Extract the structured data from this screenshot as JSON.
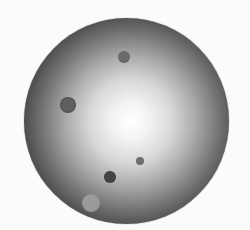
{
  "image": {
    "description": "Grayscale circular disc with radial brightness gradient (bright center, dark rim) and several small circular spots",
    "background_color": "#fbfbfb",
    "disc": {
      "cx": 126,
      "cy": 121,
      "r": 103
    },
    "spots": [
      {
        "id": "top-spot",
        "cx": 124,
        "cy": 57,
        "r": 6,
        "fill": "#6a6a6a",
        "ring": "#5a5a5a"
      },
      {
        "id": "left-ring-spot",
        "cx": 68,
        "cy": 105,
        "r": 8,
        "fill": "#5e5e5e",
        "ring": "#222222"
      },
      {
        "id": "small-right-spot",
        "cx": 140,
        "cy": 161,
        "r": 4,
        "fill": "#6e6e6e",
        "ring": "#5e5e5e"
      },
      {
        "id": "dark-ring-spot",
        "cx": 110,
        "cy": 177,
        "r": 6,
        "fill": "#444444",
        "ring": "#111111"
      },
      {
        "id": "light-spot",
        "cx": 91,
        "cy": 203,
        "r": 9,
        "fill": "#9a9a9a",
        "ring": "#8d8d8d"
      }
    ]
  }
}
